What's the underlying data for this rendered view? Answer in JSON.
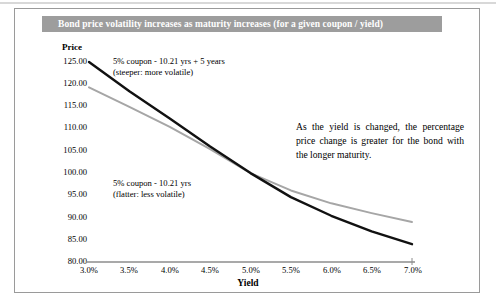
{
  "figure": {
    "title": "Bond price volatility increases as maturity increases (for a given coupon / yield)",
    "title_banner_color": "#9d9d9d",
    "title_text_color": "#ffffff",
    "border_color": "#9a9a9a",
    "background_color": "#ffffff"
  },
  "annotations": {
    "upper_line1": "5% coupon - 10.21 yrs + 5 years",
    "upper_line2": "(steeper:  more volatile)",
    "lower_line1": "5% coupon - 10.21 yrs",
    "lower_line2": "(flatter: less volatile)",
    "paragraph": "As the yield is changed, the percentage price change is greater for the bond with the longer maturity."
  },
  "chart_data": {
    "type": "line",
    "title": "Bond price volatility increases as maturity increases (for a given coupon / yield)",
    "xlabel": "Yield",
    "ylabel": "Price",
    "x": [
      3.0,
      3.5,
      4.0,
      4.5,
      5.0,
      5.5,
      6.0,
      6.5,
      7.0
    ],
    "x_tick_labels": [
      "3.0%",
      "3.5%",
      "4.0%",
      "4.5%",
      "5.0%",
      "5.5%",
      "6.0%",
      "6.5%",
      "7.0%"
    ],
    "y_tick_labels": [
      "125.00",
      "120.00",
      "115.00",
      "110.00",
      "105.00",
      "100.00",
      "95.00",
      "90.00",
      "85.00",
      "80.00"
    ],
    "y_ticks": [
      125,
      120,
      115,
      110,
      105,
      100,
      95,
      90,
      85,
      80
    ],
    "xlim": [
      3.0,
      7.0
    ],
    "ylim": [
      80,
      125
    ],
    "grid": false,
    "legend": "none",
    "series": [
      {
        "name": "5% coupon - 10.21 yrs + 5 years",
        "description": "steeper: more volatile",
        "color": "#111111",
        "width": 2.4,
        "values": [
          125.0,
          118.4,
          112.3,
          106.0,
          100.0,
          94.6,
          90.4,
          86.9,
          84.0
        ]
      },
      {
        "name": "5% coupon - 10.21 yrs",
        "description": "flatter: less volatile",
        "color": "#a6a6a6",
        "width": 2.0,
        "values": [
          119.3,
          114.9,
          110.4,
          105.4,
          100.0,
          96.1,
          93.2,
          91.0,
          89.0
        ]
      }
    ]
  },
  "axis": {
    "y_title": "Price",
    "x_title": "Yield",
    "axis_line_color": "#8c8c8c"
  }
}
